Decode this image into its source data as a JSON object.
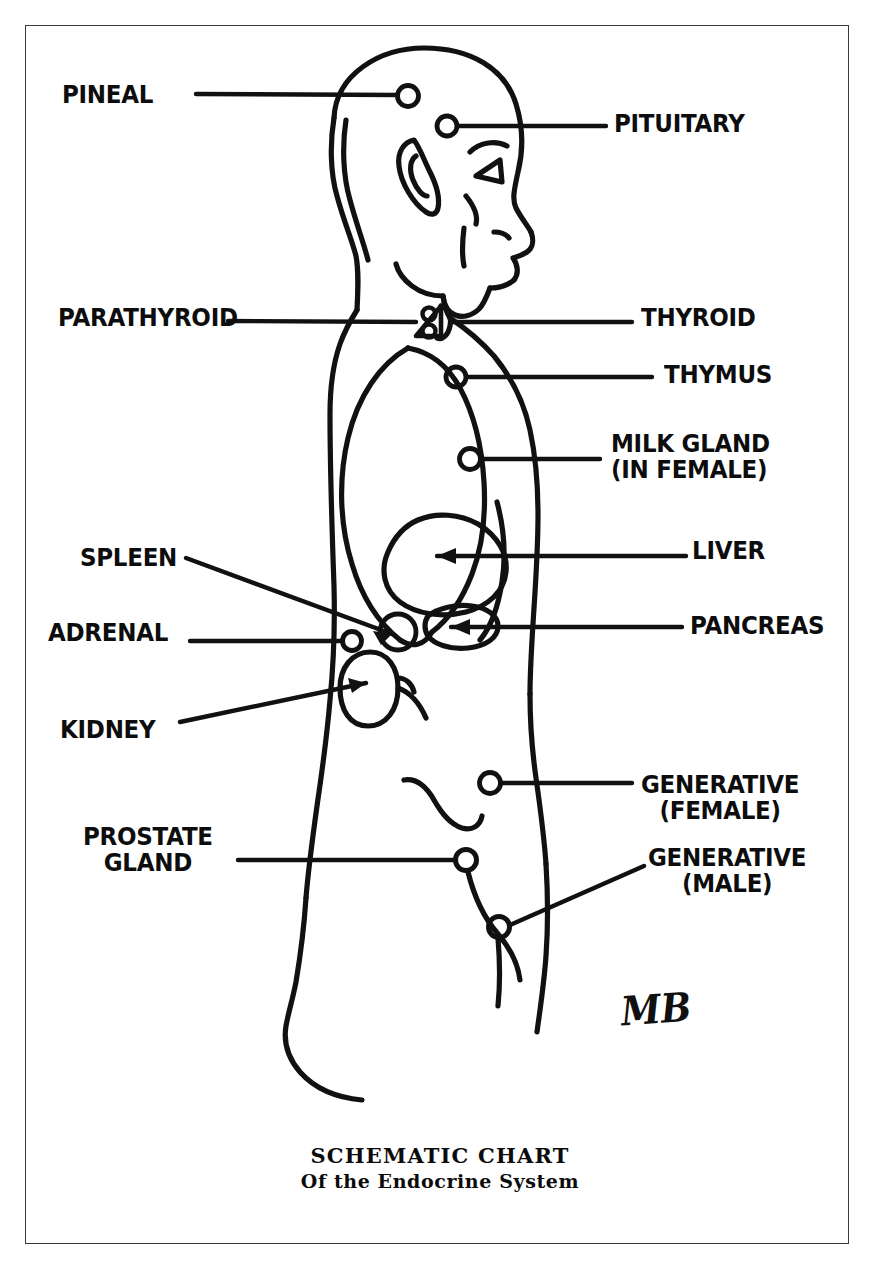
{
  "diagram": {
    "title": "SCHEMATIC CHART",
    "subtitle": "Of the Endocrine System",
    "signature": "MB",
    "ink_color": "#111111",
    "background_color": "#ffffff",
    "frame_color": "#3a3a3a",
    "figure_description": "Side profile line drawing of a human figure facing right, from head to upper thigh, with endocrine glands marked by small circles and arrows.",
    "labels_left": [
      {
        "id": "pineal",
        "text": "PINEAL",
        "x": 62,
        "y": 82
      },
      {
        "id": "parathyroid",
        "text": "PARATHYROID",
        "x": 58,
        "y": 305
      },
      {
        "id": "spleen",
        "text": "SPLEEN",
        "x": 80,
        "y": 545
      },
      {
        "id": "adrenal",
        "text": "ADRENAL",
        "x": 48,
        "y": 620
      },
      {
        "id": "kidney",
        "text": "KIDNEY",
        "x": 60,
        "y": 717
      },
      {
        "id": "prostate-gland",
        "text": "PROSTATE\nGLAND",
        "x": 83,
        "y": 824
      }
    ],
    "labels_right": [
      {
        "id": "pituitary",
        "text": "PITUITARY",
        "x": 614,
        "y": 111
      },
      {
        "id": "thyroid",
        "text": "THYROID",
        "x": 641,
        "y": 305
      },
      {
        "id": "thymus",
        "text": "THYMUS",
        "x": 664,
        "y": 362
      },
      {
        "id": "milk-gland",
        "text": "MILK GLAND\n(IN FEMALE)",
        "x": 637,
        "y": 431
      },
      {
        "id": "liver",
        "text": "LIVER",
        "x": 692,
        "y": 538
      },
      {
        "id": "pancreas",
        "text": "PANCREAS",
        "x": 690,
        "y": 613
      },
      {
        "id": "generative-female",
        "text": "GENERATIVE\n(FEMALE)",
        "x": 641,
        "y": 772
      },
      {
        "id": "generative-male",
        "text": "GENERATIVE\n(MALE)",
        "x": 648,
        "y": 845
      }
    ],
    "glands": [
      {
        "id": "pineal",
        "marker": "circle",
        "x": 408,
        "y": 96
      },
      {
        "id": "pituitary",
        "marker": "circle",
        "x": 447,
        "y": 126
      },
      {
        "id": "parathyroid",
        "marker": "circle-pair",
        "x": 430,
        "y": 320
      },
      {
        "id": "thyroid",
        "marker": "triangle",
        "x": 424,
        "y": 322
      },
      {
        "id": "thymus",
        "marker": "circle",
        "x": 456,
        "y": 377
      },
      {
        "id": "milk-gland",
        "marker": "circle",
        "x": 470,
        "y": 459
      },
      {
        "id": "liver",
        "marker": "arrow-shape",
        "x": 437,
        "y": 557
      },
      {
        "id": "spleen",
        "marker": "circle-arrow",
        "x": 398,
        "y": 632
      },
      {
        "id": "adrenal",
        "marker": "circle",
        "x": 352,
        "y": 641
      },
      {
        "id": "kidney",
        "marker": "bean-arrow",
        "x": 372,
        "y": 685
      },
      {
        "id": "pancreas",
        "marker": "blob-arrow",
        "x": 450,
        "y": 626
      },
      {
        "id": "generative-female",
        "marker": "circle",
        "x": 490,
        "y": 783
      },
      {
        "id": "prostate-gland",
        "marker": "circle",
        "x": 466,
        "y": 860
      },
      {
        "id": "generative-male",
        "marker": "circle",
        "x": 499,
        "y": 927
      }
    ]
  }
}
